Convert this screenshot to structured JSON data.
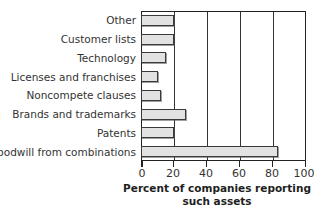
{
  "chart_data": {
    "type": "bar",
    "orientation": "horizontal",
    "title": "",
    "xlabel": "Percent of companies reporting such assets",
    "ylabel": "",
    "categories": [
      "Other",
      "Customer lists",
      "Technology",
      "Licenses and franchises",
      "Noncompete clauses",
      "Brands and trademarks",
      "Patents",
      "Goodwill from combinations"
    ],
    "values": [
      20,
      20,
      15,
      10,
      12,
      27,
      20,
      83
    ],
    "xlim": [
      0,
      100
    ],
    "xticks": [
      0,
      20,
      40,
      60,
      80,
      100
    ],
    "xtick_labels": [
      "0",
      "20",
      "40",
      "60",
      "80",
      "100"
    ],
    "gridlines": [
      20,
      40,
      60,
      80
    ],
    "grid": true,
    "legend": "none",
    "bar_fill_color": "#e2e2e2",
    "bar_edge_color": "#3a3a3a",
    "frame_color": "#222222"
  },
  "caption": {
    "line1": "Percent of companies reporting",
    "line2": "such assets"
  },
  "axis": {
    "tick_0": "0",
    "tick_1": "20",
    "tick_2": "40",
    "tick_3": "60",
    "tick_4": "80",
    "tick_5": "100"
  },
  "labels": {
    "c0": "Other",
    "c1": "Customer lists",
    "c2": "Technology",
    "c3": "Licenses and franchises",
    "c4": "Noncompete clauses",
    "c5": "Brands and trademarks",
    "c6": "Patents",
    "c7": "Goodwill from combinations"
  }
}
